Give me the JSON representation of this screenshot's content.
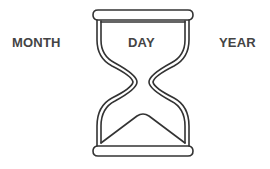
{
  "diagram": {
    "type": "hourglass-illustration",
    "labels": {
      "left": "MONTH",
      "center": "DAY",
      "right": "YEAR"
    },
    "icon": "hourglass-icon",
    "colors": {
      "background": "#ffffff",
      "stroke": "#333333",
      "text": "#444444"
    }
  }
}
